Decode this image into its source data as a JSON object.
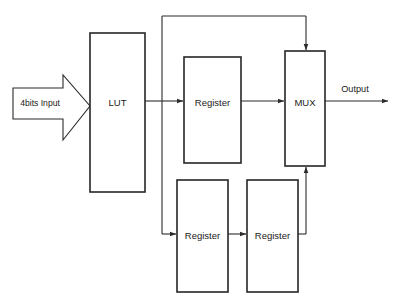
{
  "diagram": {
    "background_color": "#ffffff",
    "line_color": "#2b2b2b",
    "box_stroke_color": "#262626",
    "blocks": [
      {
        "id": "lut",
        "label": "LUT",
        "x": 90,
        "y": 33,
        "w": 55,
        "h": 159
      },
      {
        "id": "reg_top",
        "label": "Register",
        "x": 184,
        "y": 57,
        "w": 57,
        "h": 106
      },
      {
        "id": "mux",
        "label": "MUX",
        "x": 285,
        "y": 51,
        "w": 40,
        "h": 115
      },
      {
        "id": "reg_bot_l",
        "label": "Register",
        "x": 177,
        "y": 180,
        "w": 51,
        "h": 112
      },
      {
        "id": "reg_bot_r",
        "label": "Register",
        "x": 247,
        "y": 180,
        "w": 51,
        "h": 112
      }
    ],
    "io": {
      "input_label": "4bits Input",
      "output_label": "Output"
    }
  }
}
